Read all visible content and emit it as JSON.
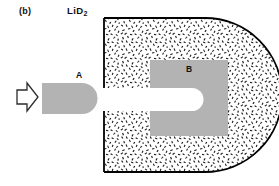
{
  "figure": {
    "panel_label": "(b)",
    "material_label": "LiD",
    "material_subscript": "2",
    "region_a_label": "A",
    "region_b_label": "B",
    "impact_arrow": "arrow-right-outline",
    "colors": {
      "background": "#ffffff",
      "outline": "#000000",
      "shaded_region": "#b3b3b3",
      "cavity": "#ffffff",
      "stipple_ink": "#1a1a1a",
      "text": "#111111"
    },
    "geometry": {
      "arrow": {
        "x": 16,
        "y": 83,
        "width": 22,
        "height": 28
      },
      "region_a": {
        "x": 42,
        "y": 83,
        "width": 56,
        "height": 31,
        "right_end": "rounded"
      },
      "body": {
        "x": 104,
        "y": 18,
        "width": 168,
        "height": 154,
        "right_end": "rounded",
        "fill": "stipple"
      },
      "cavity": {
        "x": 104,
        "y": 88,
        "width": 100,
        "height": 23,
        "right_end": "rounded"
      },
      "region_b": {
        "x": 150,
        "y": 60,
        "width": 78,
        "height": 76
      }
    }
  }
}
